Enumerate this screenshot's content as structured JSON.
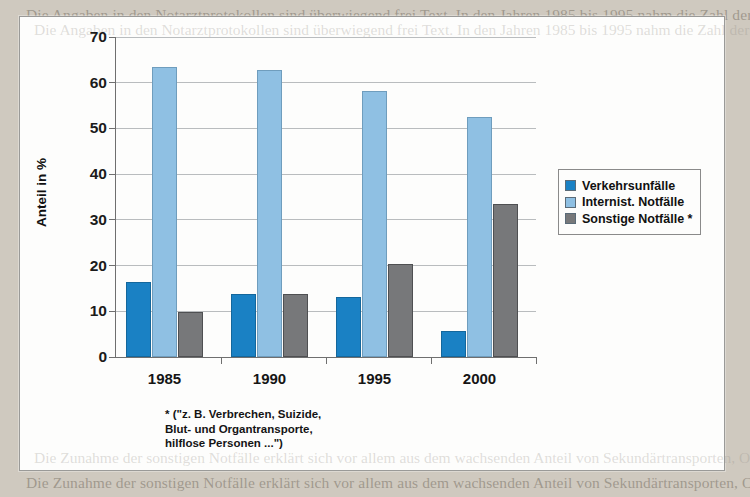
{
  "background": {
    "top_text": "Die Angaben in den Notarztprotokollen sind überwiegend frei Text. In den Jahren 1985 bis 1995 nahm die Zahl der Quoten ab. Die Auswertung für die Rettungsstellen ergab ebenfalls eine Verschiebung der Einsätze in Richtung internistischer Notfälle, während die Zahl der Verkehrsunfälle deutlich zurückging.",
    "bottom_text": "Die Zunahme der sonstigen Notfälle erklärt sich vor allem aus dem wachsenden Anteil von Sekundärtransporten, Organtransporten und Einsatzarten wie hilflosen Personen. Damit verändert sich das Anforderungsprofil an die Notarztqualifikation nachhaltig."
  },
  "chart_data": {
    "type": "bar",
    "title": "",
    "xlabel": "",
    "ylabel": "Anteil in %",
    "ylim": [
      0,
      70
    ],
    "ytick_step": 10,
    "yticks": [
      0,
      10,
      20,
      30,
      40,
      50,
      60,
      70
    ],
    "grid": true,
    "grid_axis": "y",
    "legend_position": "right-middle",
    "categories": [
      "1985",
      "1990",
      "1995",
      "2000"
    ],
    "series": [
      {
        "name": "Verkehrsunfälle",
        "color": "#1a81c4",
        "values": [
          16.4,
          13.8,
          13.2,
          5.6
        ]
      },
      {
        "name": "Internist. Notfälle",
        "color": "#8fc0e3",
        "values": [
          63.5,
          62.8,
          58.1,
          52.6
        ]
      },
      {
        "name": "Sonstige Notfälle *",
        "color": "#77787a",
        "values": [
          9.8,
          13.8,
          20.4,
          33.4
        ]
      }
    ],
    "footnote": "* (\"z. B. Verbrechen, Suizide,\nBlut- und Organtransporte,\nhilflose Personen ...\")"
  }
}
